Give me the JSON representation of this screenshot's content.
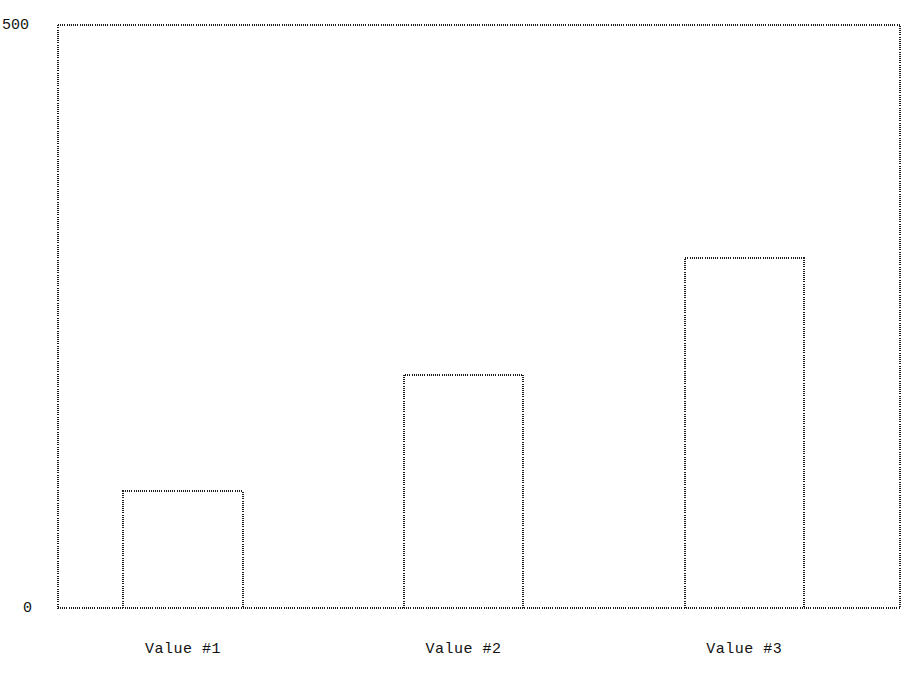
{
  "chart_data": {
    "type": "bar",
    "title": "",
    "title_note": "title is clipped off the top edge of the screenshot and is illegible",
    "xlabel": "",
    "ylabel": "",
    "categories": [
      "Value #1",
      "Value #2",
      "Value #3"
    ],
    "values": [
      100,
      200,
      300
    ],
    "ylim": [
      0,
      500
    ],
    "ytick_labels": [
      "0",
      "500"
    ],
    "grid": false,
    "legend": false,
    "legend_position": "none",
    "bar_style": "outline-only",
    "colors": {
      "background": "#ffffff",
      "line": "#1c1c1c",
      "text": "#111111"
    }
  },
  "axis": {
    "y_max_label": "500",
    "y_min_label": "0"
  },
  "title": {
    "text": ""
  }
}
